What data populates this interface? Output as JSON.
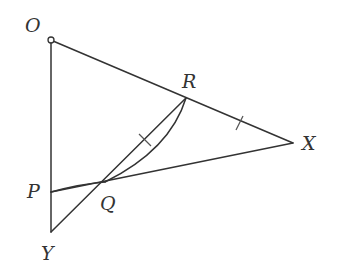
{
  "diagram": {
    "type": "geometry",
    "colors": {
      "stroke": "#333333",
      "label": "#333333",
      "background": "#ffffff"
    },
    "points": {
      "O": {
        "label": "O",
        "x": 51,
        "y": 40,
        "label_x": 25,
        "label_y": 32,
        "marker": "open-circle"
      },
      "R": {
        "label": "R",
        "x": 186,
        "y": 98,
        "label_x": 186,
        "label_y": 88
      },
      "X": {
        "label": "X",
        "x": 293,
        "y": 143,
        "label_x": 302,
        "label_y": 150
      },
      "P": {
        "label": "P",
        "x": 51,
        "y": 192,
        "label_x": 27,
        "label_y": 198
      },
      "Q": {
        "label": "Q",
        "x": 105,
        "y": 182,
        "label_x": 100,
        "label_y": 210
      },
      "Y": {
        "label": "Y",
        "x": 51,
        "y": 232,
        "label_x": 41,
        "label_y": 260
      }
    },
    "segments": [
      {
        "from": "O",
        "to": "X",
        "kind": "straight"
      },
      {
        "from": "O",
        "to": "Y",
        "kind": "straight"
      },
      {
        "from": "P",
        "to": "X",
        "kind": "straight"
      },
      {
        "from": "Y",
        "to": "R",
        "kind": "straight",
        "through": "Q"
      },
      {
        "from": "Q",
        "to": "R",
        "kind": "arc"
      },
      {
        "from": "P",
        "to": "Q",
        "kind": "arc"
      }
    ],
    "tick_marks": [
      {
        "on": "RX",
        "x": 240,
        "y": 123
      },
      {
        "on": "QR",
        "x": 145,
        "y": 140
      }
    ]
  }
}
